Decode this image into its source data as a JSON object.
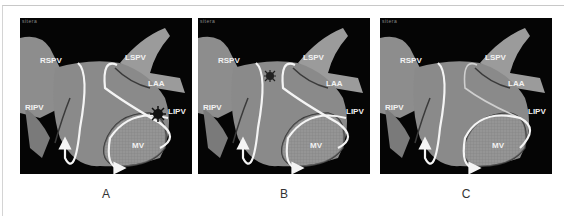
{
  "figure": {
    "panels": [
      {
        "id": "A",
        "label": "A",
        "corner_text": "sitera",
        "anatomy_labels": {
          "rspv": "RSPV",
          "ripv": "RIPV",
          "lspv": "LSPV",
          "laa": "LAA",
          "lipv": "LIPV",
          "mv": "MV"
        },
        "marker": {
          "present": true,
          "location": "LIPV-mitral isthmus"
        }
      },
      {
        "id": "B",
        "label": "B",
        "corner_text": "sitera",
        "anatomy_labels": {
          "rspv": "RSPV",
          "ripv": "RIPV",
          "lspv": "LSPV",
          "laa": "LAA",
          "lipv": "LIPV",
          "mv": "MV"
        },
        "marker": {
          "present": true,
          "location": "roof"
        }
      },
      {
        "id": "C",
        "label": "C",
        "corner_text": "sitera",
        "anatomy_labels": {
          "rspv": "RSPV",
          "ripv": "RIPV",
          "lspv": "LSPV",
          "laa": "LAA",
          "lipv": "LIPV",
          "mv": "MV"
        },
        "marker": {
          "present": false
        }
      }
    ],
    "colors": {
      "background": "#050505",
      "anatomy": "#9a9a9a",
      "arrow": "#f4f4f4",
      "ablation_line": "#3a3a3a",
      "marker": "#111111"
    }
  }
}
